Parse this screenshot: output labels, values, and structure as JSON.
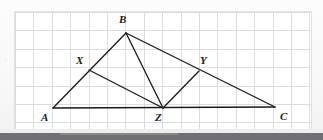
{
  "document": {
    "type": "geometry-diagram",
    "background_color": "#fbfbfb",
    "panel_color": "#ffffff",
    "grid_color": "#d9dde0",
    "line_color": "#1a1a1a",
    "margin_mark": "·"
  },
  "grid": {
    "left": 15,
    "top": 12,
    "width": 296,
    "height": 117,
    "cell_size": 18.4,
    "columns": 16,
    "rows": 6,
    "visible": true
  },
  "figure": {
    "points": [
      {
        "id": "A",
        "label": "A",
        "x": 53,
        "y": 108,
        "label_x": 41,
        "label_y": 112
      },
      {
        "id": "B",
        "label": "B",
        "x": 126,
        "y": 33,
        "label_x": 119,
        "label_y": 14
      },
      {
        "id": "C",
        "label": "C",
        "x": 275,
        "y": 107,
        "label_x": 280,
        "label_y": 111
      },
      {
        "id": "X",
        "label": "X",
        "x": 89,
        "y": 70,
        "label_x": 76,
        "label_y": 55
      },
      {
        "id": "Y",
        "label": "Y",
        "x": 199,
        "y": 71,
        "label_x": 200,
        "label_y": 55
      },
      {
        "id": "Z",
        "label": "Z",
        "x": 163,
        "y": 108,
        "label_x": 155,
        "label_y": 112
      }
    ],
    "segments": [
      {
        "name": "side-AB",
        "from": "A",
        "to": "B"
      },
      {
        "name": "side-BC",
        "from": "B",
        "to": "C"
      },
      {
        "name": "side-AC",
        "from": "A",
        "to": "C"
      },
      {
        "name": "cevian-BZ",
        "from": "B",
        "to": "Z"
      },
      {
        "name": "midsegment-XZ",
        "from": "X",
        "to": "Z"
      },
      {
        "name": "midsegment-YZ",
        "from": "Y",
        "to": "Z"
      }
    ],
    "stroke_width": 1.3
  },
  "chrome": {
    "light_bar_color": "#ededed",
    "dark_bar_color": "#6e7073"
  }
}
